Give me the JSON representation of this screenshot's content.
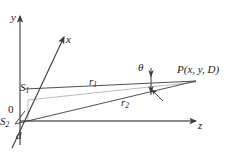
{
  "figure": {
    "kind": "geometry-diagram",
    "background_color": "#ffffff",
    "stroke_color": "#3b3b3b",
    "light_stroke_color": "#9a9a9a",
    "text_color": "#1a1a1a",
    "width": 229,
    "height": 156
  },
  "axes": [
    {
      "name": "y-axis",
      "label": "y",
      "label_x": 11,
      "label_y": 12
    },
    {
      "name": "x-axis",
      "label": "x",
      "label_x": 66,
      "label_y": 34
    },
    {
      "name": "z-axis",
      "label": "z",
      "label_x": 198,
      "label_y": 120
    }
  ],
  "points": [
    {
      "name": "origin",
      "label": "0",
      "sub": "",
      "label_x": 8,
      "label_y": 104
    },
    {
      "name": "source-1",
      "label": "S",
      "sub": "1",
      "label_x": 20,
      "label_y": 82
    },
    {
      "name": "source-2",
      "label": "S",
      "sub": "2",
      "label_x": 0,
      "label_y": 116
    },
    {
      "name": "field-point",
      "label": "P(x, y, D)",
      "sub": "",
      "label_x": 177,
      "label_y": 64
    }
  ],
  "segments": [
    {
      "name": "r1",
      "label": "r",
      "sub": "1",
      "label_x": 89,
      "label_y": 76
    },
    {
      "name": "r2",
      "label": "r",
      "sub": "2",
      "label_x": 121,
      "label_y": 97
    }
  ],
  "annotations": [
    {
      "name": "angle-theta",
      "label": "θ",
      "sub": "",
      "label_x": 138,
      "label_y": 62
    },
    {
      "name": "separation-d",
      "label": "d",
      "sub": "",
      "label_x": 16,
      "label_y": 130
    }
  ]
}
